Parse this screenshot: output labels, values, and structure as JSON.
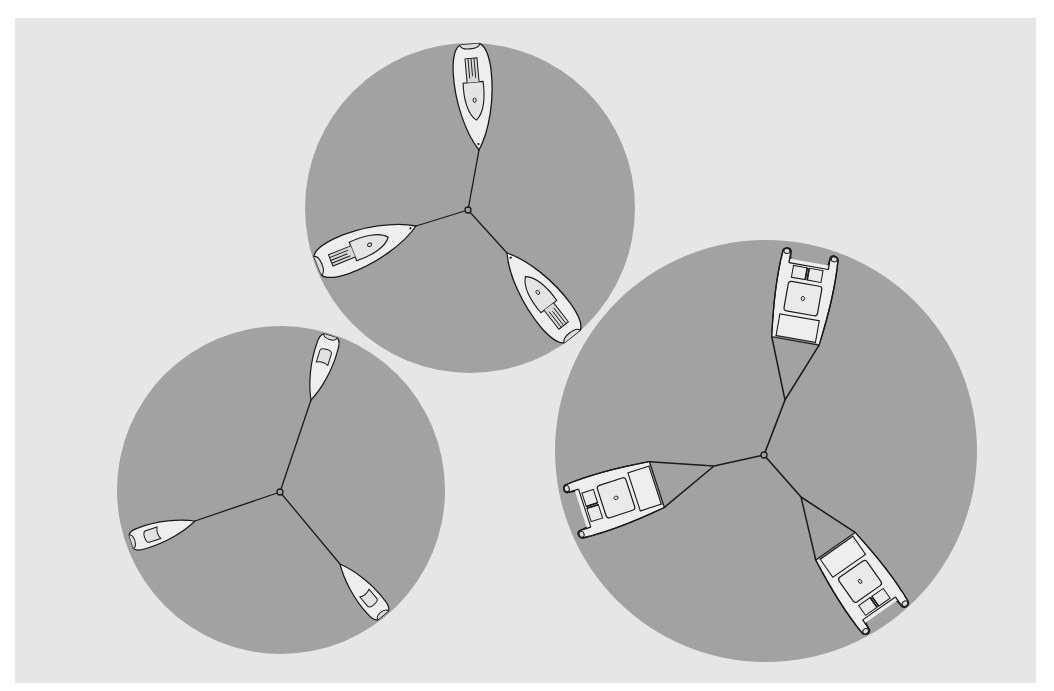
{
  "figure": {
    "colors": {
      "page": "#ffffff",
      "background": "#e6e6e6",
      "circle": "#a2a2a2",
      "hull": "#eeeeee",
      "line": "#1a1a1a"
    },
    "groups": [
      {
        "id": "keelboats",
        "circle": {
          "cx": 470,
          "cy": 208,
          "r": 165
        },
        "hub": {
          "x": 468,
          "y": 210
        },
        "boat_type": "keelboat",
        "boats": [
          {
            "bow": [
              479,
              150
            ],
            "angle": 175,
            "length": 108
          },
          {
            "bow": [
              416,
              226
            ],
            "angle": 68,
            "length": 104
          },
          {
            "bow": [
              507,
              253
            ],
            "angle": -38,
            "length": 108
          }
        ]
      },
      {
        "id": "dinghies",
        "circle": {
          "cx": 281,
          "cy": 490,
          "r": 164
        },
        "hub": {
          "x": 280,
          "y": 492
        },
        "boat_type": "dinghy",
        "boats": [
          {
            "bow": [
              311,
              400
            ],
            "angle": 197,
            "length": 70
          },
          {
            "bow": [
              195,
              521
            ],
            "angle": 72,
            "length": 66
          },
          {
            "bow": [
              340,
              564
            ],
            "angle": -40,
            "length": 66
          }
        ]
      },
      {
        "id": "catamarans",
        "circle": {
          "cx": 766,
          "cy": 451,
          "r": 211
        },
        "hub": {
          "x": 764,
          "y": 455
        },
        "boat_type": "catamaran",
        "boats": [
          {
            "bridle": [
              785,
              400
            ],
            "angle": 190,
            "length": 150
          },
          {
            "bridle": [
              714,
              466
            ],
            "angle": 72,
            "length": 150
          },
          {
            "bridle": [
              801,
              497
            ],
            "angle": -35,
            "length": 150
          }
        ]
      }
    ]
  }
}
